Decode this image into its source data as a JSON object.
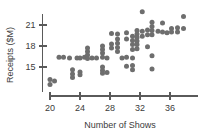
{
  "chart_data": {
    "type": "scatter",
    "title": "",
    "xlabel": "Number of Shows",
    "ylabel": "Receipts ($M)",
    "xlim": [
      19,
      38.5
    ],
    "ylim": [
      12,
      23.5
    ],
    "grid": false,
    "legend": "none",
    "xticks": [
      20,
      24,
      28,
      32,
      36
    ],
    "xtick_labels": [
      "20",
      "24",
      "28",
      "32",
      "36"
    ],
    "yticks": [
      15,
      18,
      21
    ],
    "ytick_labels": [
      "15",
      "18",
      "21"
    ],
    "marker_color": "#6e6e6e",
    "axis_color": "#5a5a5a",
    "points": [
      [
        20.0,
        13.2
      ],
      [
        20.0,
        12.5
      ],
      [
        20.6,
        13.0
      ],
      [
        21.2,
        16.4
      ],
      [
        21.8,
        16.4
      ],
      [
        22.6,
        16.3
      ],
      [
        23.0,
        14.6
      ],
      [
        23.0,
        14.0
      ],
      [
        23.0,
        13.5
      ],
      [
        23.6,
        16.3
      ],
      [
        24.0,
        16.3
      ],
      [
        24.0,
        14.3
      ],
      [
        24.0,
        13.9
      ],
      [
        24.6,
        16.4
      ],
      [
        25.0,
        17.7
      ],
      [
        25.0,
        17.2
      ],
      [
        25.0,
        16.7
      ],
      [
        25.0,
        16.2
      ],
      [
        25.6,
        16.3
      ],
      [
        26.2,
        16.3
      ],
      [
        27.0,
        18.0
      ],
      [
        27.0,
        17.5
      ],
      [
        27.0,
        17.0
      ],
      [
        27.0,
        16.4
      ],
      [
        27.0,
        15.0
      ],
      [
        27.0,
        14.5
      ],
      [
        27.0,
        14.1
      ],
      [
        27.6,
        16.3
      ],
      [
        27.6,
        14.2
      ],
      [
        28.2,
        19.8
      ],
      [
        28.2,
        18.3
      ],
      [
        28.2,
        17.7
      ],
      [
        29.0,
        19.7
      ],
      [
        29.0,
        19.0
      ],
      [
        29.0,
        18.4
      ],
      [
        29.0,
        17.8
      ],
      [
        29.0,
        17.2
      ],
      [
        29.6,
        16.3
      ],
      [
        30.2,
        19.9
      ],
      [
        30.2,
        19.0
      ],
      [
        30.2,
        16.4
      ],
      [
        30.2,
        15.1
      ],
      [
        31.0,
        19.4
      ],
      [
        31.0,
        18.8
      ],
      [
        31.0,
        18.2
      ],
      [
        31.0,
        17.5
      ],
      [
        31.0,
        16.3
      ],
      [
        31.0,
        15.2
      ],
      [
        31.0,
        14.6
      ],
      [
        31.6,
        20.2
      ],
      [
        31.6,
        19.7
      ],
      [
        31.6,
        19.2
      ],
      [
        31.6,
        18.7
      ],
      [
        31.6,
        18.2
      ],
      [
        31.6,
        17.6
      ],
      [
        32.3,
        22.9
      ],
      [
        32.3,
        20.1
      ],
      [
        32.3,
        19.4
      ],
      [
        33.0,
        20.3
      ],
      [
        33.0,
        19.6
      ],
      [
        33.0,
        17.9
      ],
      [
        33.6,
        21.4
      ],
      [
        33.6,
        20.8
      ],
      [
        33.6,
        20.2
      ],
      [
        33.6,
        19.6
      ],
      [
        33.6,
        16.6
      ],
      [
        33.6,
        14.7
      ],
      [
        34.4,
        20.1
      ],
      [
        35.0,
        21.3
      ],
      [
        35.0,
        20.0
      ],
      [
        35.6,
        19.9
      ],
      [
        36.2,
        20.5
      ],
      [
        36.2,
        20.0
      ],
      [
        37.0,
        20.6
      ],
      [
        37.0,
        20.0
      ],
      [
        37.8,
        22.2
      ],
      [
        37.8,
        20.5
      ]
    ]
  }
}
